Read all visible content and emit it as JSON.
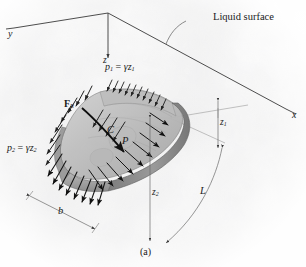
{
  "figure": {
    "caption": "(a)",
    "title_label": "Liquid surface"
  },
  "axes": [
    {
      "name": "y-axis",
      "label": "y"
    },
    {
      "name": "x-axis",
      "label": "x"
    },
    {
      "name": "z-axis",
      "label": "z"
    }
  ],
  "pressure_labels": [
    {
      "name": "pressure-top",
      "p": "p",
      "psub": "1",
      "eq": " = ",
      "gamma": "γ",
      "z": "z",
      "zsub": "1"
    },
    {
      "name": "pressure-bottom",
      "p": "p",
      "psub": "2",
      "eq": " = ",
      "gamma": "γ",
      "z": "z",
      "zsub": "2"
    }
  ],
  "force_label": {
    "symbol": "F",
    "sub": "R"
  },
  "points": [
    {
      "name": "centroid",
      "label": "C"
    },
    {
      "name": "pressure-center",
      "label": "P"
    }
  ],
  "dimensions": [
    {
      "name": "depth-z1",
      "label": "z",
      "sub": "1"
    },
    {
      "name": "depth-z2",
      "label": "z",
      "sub": "2"
    },
    {
      "name": "length-L",
      "label": "L",
      "sub": ""
    },
    {
      "name": "width-b",
      "label": "b",
      "sub": ""
    }
  ],
  "colors": {
    "ink": "#1a1a1a",
    "line": "#4a4a4a",
    "thin_line": "#8a8a8a",
    "plate_light": "#c9c9c9",
    "plate_mid": "#b0b0b0",
    "plate_dark": "#8e8e8e",
    "plate_edge": "#6f6f6f",
    "background": "#e8e8e8"
  }
}
